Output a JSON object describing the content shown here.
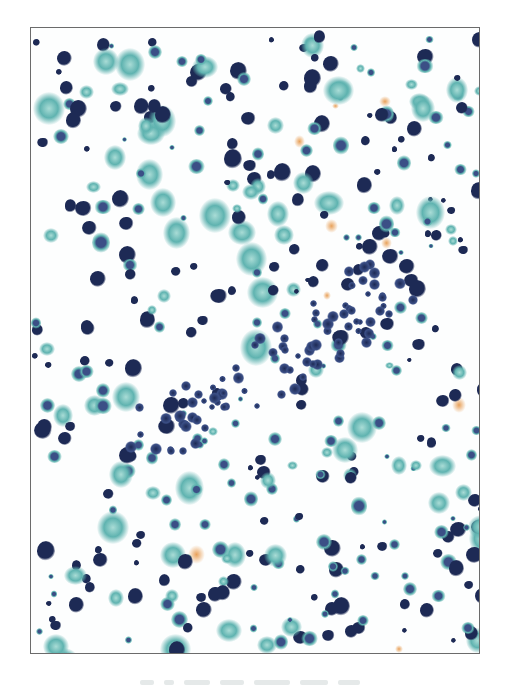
{
  "image": {
    "description": "Cytology smear micrograph (Papanicolaou stain) showing scattered dyshesive cells with dark blue/purple nuclei and cyan-green cytoplasm on white background",
    "frame": {
      "border_color": "#6b6b6b"
    },
    "colors": {
      "nucleus_dark": "#1d2a55",
      "nucleus_mid": "#3b4f86",
      "cytoplasm_cyan": "#5fb3b0",
      "cytoplasm_light": "#a9dcd6",
      "orange_fragment": "#e8a15a",
      "background": "#fdfefe"
    }
  },
  "caption": {
    "text": ""
  }
}
